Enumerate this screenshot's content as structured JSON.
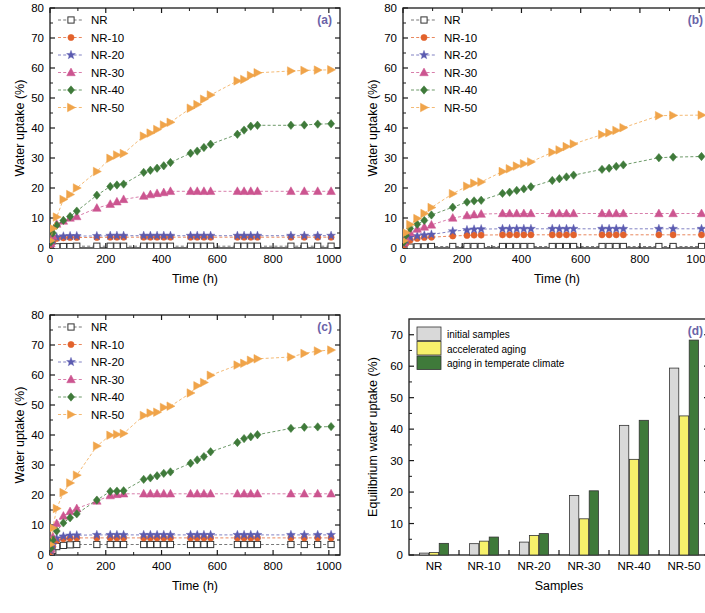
{
  "figure": {
    "panels": [
      "(a)",
      "(b)",
      "(c)",
      "(d)"
    ],
    "panel_label_color": "#6a63a8"
  },
  "series_style": {
    "NR": {
      "color": "#4d4d4d",
      "marker": "open-square"
    },
    "NR-10": {
      "color": "#e2622c",
      "marker": "circle"
    },
    "NR-20": {
      "color": "#5b5bb0",
      "marker": "star"
    },
    "NR-30": {
      "color": "#cc5590",
      "marker": "triangle-up"
    },
    "NR-40": {
      "color": "#3f7a3a",
      "marker": "diamond"
    },
    "NR-50": {
      "color": "#f0a44a",
      "marker": "triangle-right"
    }
  },
  "bar_style": {
    "initial samples": "#d9d9d9",
    "accelerated aging": "#f7f06b",
    "aging in temperate climate": "#3f7a3a"
  },
  "chart_data": [
    {
      "id": "panel-a",
      "type": "line",
      "title": "(a)",
      "xlabel": "Time (h)",
      "ylabel": "Water uptake (%)",
      "xlim": [
        0,
        1040
      ],
      "ylim": [
        0,
        80
      ],
      "xticks": [
        0,
        200,
        400,
        600,
        800,
        1000
      ],
      "yticks": [
        0,
        10,
        20,
        30,
        40,
        50,
        60,
        70,
        80
      ],
      "grid": false,
      "legend_position": "top-left",
      "x": [
        3,
        10,
        24,
        48,
        72,
        96,
        168,
        216,
        240,
        264,
        336,
        360,
        384,
        408,
        432,
        504,
        528,
        552,
        576,
        672,
        696,
        720,
        744,
        864,
        912,
        960,
        1008
      ],
      "series": [
        {
          "name": "NR",
          "values": [
            0.2,
            0.3,
            0.4,
            0.5,
            0.5,
            0.6,
            0.6,
            0.6,
            0.6,
            0.6,
            0.6,
            0.6,
            0.6,
            0.6,
            0.6,
            0.6,
            0.6,
            0.6,
            0.6,
            0.6,
            0.6,
            0.6,
            0.6,
            0.6,
            0.6,
            0.6,
            0.6
          ]
        },
        {
          "name": "NR-10",
          "values": [
            1.0,
            2.0,
            3.2,
            3.4,
            3.5,
            3.5,
            3.5,
            3.6,
            3.6,
            3.6,
            3.6,
            3.6,
            3.6,
            3.6,
            3.6,
            3.6,
            3.6,
            3.6,
            3.6,
            3.6,
            3.6,
            3.6,
            3.6,
            3.6,
            3.6,
            3.6,
            3.6
          ]
        },
        {
          "name": "NR-20",
          "values": [
            1.2,
            2.4,
            3.6,
            3.9,
            4.0,
            4.0,
            4.0,
            4.1,
            4.1,
            4.1,
            4.1,
            4.1,
            4.1,
            4.1,
            4.1,
            4.1,
            4.1,
            4.1,
            4.1,
            4.1,
            4.1,
            4.1,
            4.1,
            4.1,
            4.1,
            4.1,
            4.1
          ]
        },
        {
          "name": "NR-30",
          "values": [
            1.5,
            4.0,
            8.0,
            9.0,
            10.0,
            10.5,
            13.3,
            14.6,
            15.4,
            16.2,
            17.3,
            17.8,
            18.2,
            18.5,
            18.9,
            18.9,
            18.9,
            18.9,
            18.9,
            18.9,
            18.9,
            18.9,
            18.9,
            18.9,
            18.9,
            18.9,
            18.9
          ]
        },
        {
          "name": "NR-40",
          "values": [
            2.0,
            5.0,
            7.6,
            9.2,
            10.5,
            12.3,
            17.6,
            20.5,
            21.0,
            21.3,
            25.2,
            25.9,
            26.6,
            27.4,
            28.5,
            31.6,
            32.3,
            33.5,
            34.6,
            37.9,
            39.3,
            40.6,
            40.9,
            40.9,
            41.0,
            41.3,
            41.4
          ]
        },
        {
          "name": "NR-50",
          "values": [
            2.5,
            6.5,
            10.3,
            16.2,
            17.8,
            20.0,
            25.5,
            29.9,
            31.0,
            31.5,
            37.3,
            38.3,
            39.5,
            41.0,
            41.9,
            46.6,
            47.8,
            49.6,
            51.0,
            55.7,
            56.2,
            57.5,
            58.4,
            59.0,
            59.2,
            59.3,
            59.4
          ]
        }
      ]
    },
    {
      "id": "panel-b",
      "type": "line",
      "title": "(b)",
      "xlabel": "Time (h)",
      "ylabel": "Water uptake (%)",
      "xlim": [
        0,
        1040
      ],
      "ylim": [
        0,
        80
      ],
      "xticks": [
        0,
        200,
        400,
        600,
        800,
        1000
      ],
      "yticks": [
        0,
        10,
        20,
        30,
        40,
        50,
        60,
        70,
        80
      ],
      "grid": false,
      "legend_position": "top-left",
      "x": [
        3,
        10,
        24,
        48,
        72,
        96,
        168,
        216,
        240,
        264,
        336,
        360,
        384,
        408,
        432,
        504,
        528,
        552,
        576,
        672,
        696,
        720,
        744,
        864,
        912,
        1008
      ],
      "series": [
        {
          "name": "NR",
          "values": [
            0.1,
            0.2,
            0.3,
            0.4,
            0.4,
            0.5,
            0.5,
            0.5,
            0.5,
            0.5,
            0.5,
            0.5,
            0.5,
            0.5,
            0.5,
            0.5,
            0.5,
            0.5,
            0.5,
            0.5,
            0.5,
            0.5,
            0.5,
            0.5,
            0.5,
            0.5
          ]
        },
        {
          "name": "NR-10",
          "values": [
            0.8,
            1.6,
            2.6,
            3.2,
            3.5,
            3.6,
            4.0,
            4.2,
            4.3,
            4.3,
            4.4,
            4.4,
            4.4,
            4.4,
            4.4,
            4.4,
            4.4,
            4.4,
            4.4,
            4.4,
            4.4,
            4.4,
            4.4,
            4.4,
            4.4,
            4.4
          ]
        },
        {
          "name": "NR-20",
          "values": [
            1.5,
            2.6,
            3.6,
            4.0,
            4.3,
            4.5,
            5.6,
            6.0,
            6.2,
            6.3,
            6.4,
            6.4,
            6.4,
            6.4,
            6.4,
            6.4,
            6.4,
            6.4,
            6.4,
            6.4,
            6.4,
            6.4,
            6.4,
            6.4,
            6.4,
            6.4
          ]
        },
        {
          "name": "NR-30",
          "values": [
            1.8,
            3.4,
            5.2,
            6.3,
            7.0,
            7.7,
            10.0,
            10.8,
            11.1,
            11.3,
            11.5,
            11.5,
            11.5,
            11.5,
            11.5,
            11.5,
            11.5,
            11.5,
            11.5,
            11.5,
            11.5,
            11.5,
            11.5,
            11.5,
            11.5,
            11.5
          ]
        },
        {
          "name": "NR-40",
          "values": [
            2.0,
            4.2,
            6.5,
            7.9,
            9.2,
            11.0,
            13.6,
            15.3,
            15.7,
            15.9,
            18.2,
            18.6,
            19.2,
            19.7,
            20.4,
            22.5,
            23.1,
            23.7,
            24.3,
            26.2,
            26.6,
            27.2,
            27.7,
            30.1,
            30.3,
            30.5
          ]
        },
        {
          "name": "NR-50",
          "values": [
            2.4,
            5.1,
            7.8,
            9.8,
            11.5,
            13.5,
            18.1,
            20.6,
            21.6,
            22.0,
            25.5,
            26.4,
            27.3,
            28.1,
            28.7,
            31.9,
            32.7,
            33.8,
            34.7,
            37.8,
            38.4,
            39.2,
            40.1,
            44.1,
            44.2,
            44.3
          ]
        }
      ]
    },
    {
      "id": "panel-c",
      "type": "line",
      "title": "(c)",
      "xlabel": "Time (h)",
      "ylabel": "Water uptake (%)",
      "xlim": [
        0,
        1040
      ],
      "ylim": [
        0,
        80
      ],
      "xticks": [
        0,
        200,
        400,
        600,
        800,
        1000
      ],
      "yticks": [
        0,
        10,
        20,
        30,
        40,
        50,
        60,
        70,
        80
      ],
      "grid": false,
      "legend_position": "top-left",
      "x": [
        3,
        10,
        24,
        48,
        72,
        96,
        168,
        216,
        240,
        264,
        336,
        360,
        384,
        408,
        432,
        504,
        528,
        552,
        576,
        672,
        696,
        720,
        744,
        864,
        912,
        960,
        1008
      ],
      "series": [
        {
          "name": "NR",
          "values": [
            0.5,
            1.5,
            2.8,
            3.2,
            3.4,
            3.5,
            3.5,
            3.5,
            3.5,
            3.5,
            3.5,
            3.5,
            3.5,
            3.5,
            3.5,
            3.5,
            3.5,
            3.5,
            3.5,
            3.5,
            3.5,
            3.5,
            3.5,
            3.5,
            3.5,
            3.5,
            3.5
          ]
        },
        {
          "name": "NR-10",
          "values": [
            1.0,
            2.8,
            4.8,
            5.4,
            5.6,
            5.7,
            5.7,
            5.7,
            5.7,
            5.7,
            5.7,
            5.7,
            5.7,
            5.7,
            5.7,
            5.7,
            5.7,
            5.7,
            5.7,
            5.7,
            5.7,
            5.7,
            5.7,
            5.7,
            5.7,
            5.7,
            5.7
          ]
        },
        {
          "name": "NR-20",
          "values": [
            1.4,
            3.4,
            5.6,
            6.2,
            6.5,
            6.6,
            6.7,
            6.7,
            6.7,
            6.7,
            6.7,
            6.7,
            6.7,
            6.7,
            6.7,
            6.7,
            6.7,
            6.7,
            6.7,
            6.7,
            6.7,
            6.7,
            6.7,
            6.7,
            6.7,
            6.7,
            6.7
          ]
        },
        {
          "name": "NR-30",
          "values": [
            2.0,
            6.0,
            10.5,
            13.0,
            14.5,
            15.5,
            18.0,
            19.8,
            20.2,
            20.4,
            20.4,
            20.4,
            20.4,
            20.4,
            20.4,
            20.4,
            20.4,
            20.4,
            20.4,
            20.4,
            20.4,
            20.4,
            20.4,
            20.4,
            20.4,
            20.4,
            20.4
          ]
        },
        {
          "name": "NR-40",
          "values": [
            2.2,
            5.0,
            8.0,
            10.7,
            12.4,
            13.7,
            18.3,
            21.2,
            21.3,
            21.4,
            25.2,
            25.7,
            26.4,
            27.2,
            27.7,
            30.6,
            31.7,
            32.8,
            34.4,
            37.5,
            38.8,
            39.4,
            40.1,
            42.2,
            42.6,
            42.7,
            42.8
          ]
        },
        {
          "name": "NR-50",
          "values": [
            3.5,
            9.0,
            15.5,
            20.8,
            24.0,
            26.6,
            36.3,
            39.9,
            40.2,
            40.5,
            46.5,
            47.3,
            47.6,
            49.2,
            49.6,
            54.0,
            56.4,
            57.5,
            59.9,
            63.3,
            63.9,
            64.9,
            65.4,
            66.0,
            67.2,
            68.0,
            68.3
          ]
        }
      ]
    },
    {
      "id": "panel-d",
      "type": "bar",
      "title": "(d)",
      "xlabel": "Samples",
      "ylabel": "Equilibrium water uptake (%)",
      "ylim": [
        0,
        75
      ],
      "yticks": [
        0,
        10,
        20,
        30,
        40,
        50,
        60,
        70
      ],
      "grid": false,
      "legend_position": "top-left",
      "categories": [
        "NR",
        "NR-10",
        "NR-20",
        "NR-30",
        "NR-40",
        "NR-50"
      ],
      "series": [
        {
          "name": "initial samples",
          "values": [
            0.6,
            3.6,
            4.1,
            18.9,
            41.2,
            59.4
          ]
        },
        {
          "name": "accelerated aging",
          "values": [
            0.8,
            4.4,
            6.2,
            11.5,
            30.4,
            44.2
          ]
        },
        {
          "name": "aging in temperate climate",
          "values": [
            3.7,
            5.7,
            6.8,
            20.4,
            42.8,
            68.3
          ]
        }
      ]
    }
  ]
}
